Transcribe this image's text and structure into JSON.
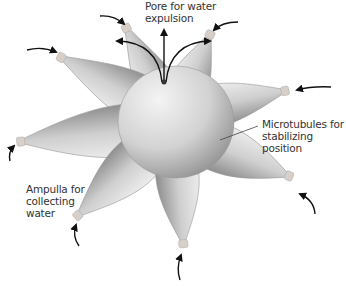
{
  "diagram": {
    "labels": {
      "pore": {
        "line1": "Pore for water",
        "line2": "expulsion"
      },
      "microtubules": {
        "line1": "Microtubules for",
        "line2": "stabilizing position"
      },
      "ampulla": {
        "line1": "Ampulla for",
        "line2": "collecting",
        "line3": "water"
      }
    },
    "colors": {
      "background": "#ffffff",
      "body_light": "#e8e8e8",
      "body_dark": "#8a8a8a",
      "arrow": "#111111",
      "text": "#333333"
    },
    "ampullae": [
      {
        "name": "top-left",
        "tip": [
          127,
          27
        ]
      },
      {
        "name": "top-right",
        "tip": [
          210,
          34
        ]
      },
      {
        "name": "upper-left",
        "tip": [
          60,
          56
        ]
      },
      {
        "name": "right",
        "tip": [
          288,
          90
        ]
      },
      {
        "name": "left",
        "tip": [
          18,
          141
        ]
      },
      {
        "name": "lower-right",
        "tip": [
          290,
          190
        ]
      },
      {
        "name": "lower-left",
        "tip": [
          77,
          216
        ]
      },
      {
        "name": "bottom",
        "tip": [
          183,
          245
        ]
      }
    ]
  }
}
